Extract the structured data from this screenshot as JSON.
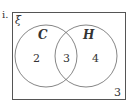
{
  "question_label": "i.",
  "universal_symbol": "ξ",
  "sets": [
    {
      "name": "C",
      "only_count": "2"
    },
    {
      "name": "H",
      "only_count": "4"
    }
  ],
  "intersection_count": "3",
  "outside_count": "3",
  "colors": {
    "line": "#555555",
    "text": "#333333",
    "background": "#ffffff"
  }
}
